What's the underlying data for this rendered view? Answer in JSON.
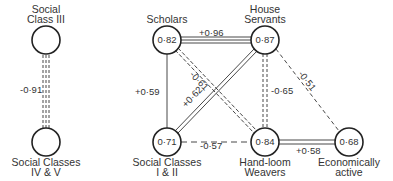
{
  "left_diagram": {
    "nodes": [
      {
        "id": "sc3",
        "label_line1": "Social",
        "label_line2": "Class III",
        "value": ""
      },
      {
        "id": "sc45",
        "label_line1": "Social Classes",
        "label_line2": "IV & V",
        "value": ""
      }
    ],
    "edges": [
      {
        "from": "sc3",
        "to": "sc45",
        "value": "-0·91",
        "style": "triple-dashed"
      }
    ]
  },
  "right_diagram": {
    "nodes": [
      {
        "id": "scholars",
        "label_line1": "Scholars",
        "label_line2": "",
        "value": "0·82"
      },
      {
        "id": "house",
        "label_line1": "House",
        "label_line2": "Servants",
        "value": "0·87"
      },
      {
        "id": "sc12",
        "label_line1": "Social Classes",
        "label_line2": "I & II",
        "value": "0·71"
      },
      {
        "id": "handloom",
        "label_line1": "Hand-loom",
        "label_line2": "Weavers",
        "value": "0·84"
      },
      {
        "id": "econ",
        "label_line1": "Economically",
        "label_line2": "active",
        "value": "0·68"
      }
    ],
    "edges": [
      {
        "from": "scholars",
        "to": "house",
        "value": "+0·96",
        "style": "triple-solid"
      },
      {
        "from": "scholars",
        "to": "sc12",
        "value": "+0·59",
        "style": "single-solid"
      },
      {
        "from": "scholars",
        "to": "handloom",
        "value": "-0·61",
        "style": "double-dashed"
      },
      {
        "from": "sc12",
        "to": "house",
        "value": "+0·62",
        "style": "double-solid"
      },
      {
        "from": "house",
        "to": "handloom",
        "value": "-0·65",
        "style": "double-dashed"
      },
      {
        "from": "house",
        "to": "econ",
        "value": "-0·51",
        "style": "single-dashed"
      },
      {
        "from": "sc12",
        "to": "handloom",
        "value": "-0·57",
        "style": "single-dashed"
      },
      {
        "from": "handloom",
        "to": "econ",
        "value": "+0·58",
        "style": "double-solid"
      }
    ]
  }
}
